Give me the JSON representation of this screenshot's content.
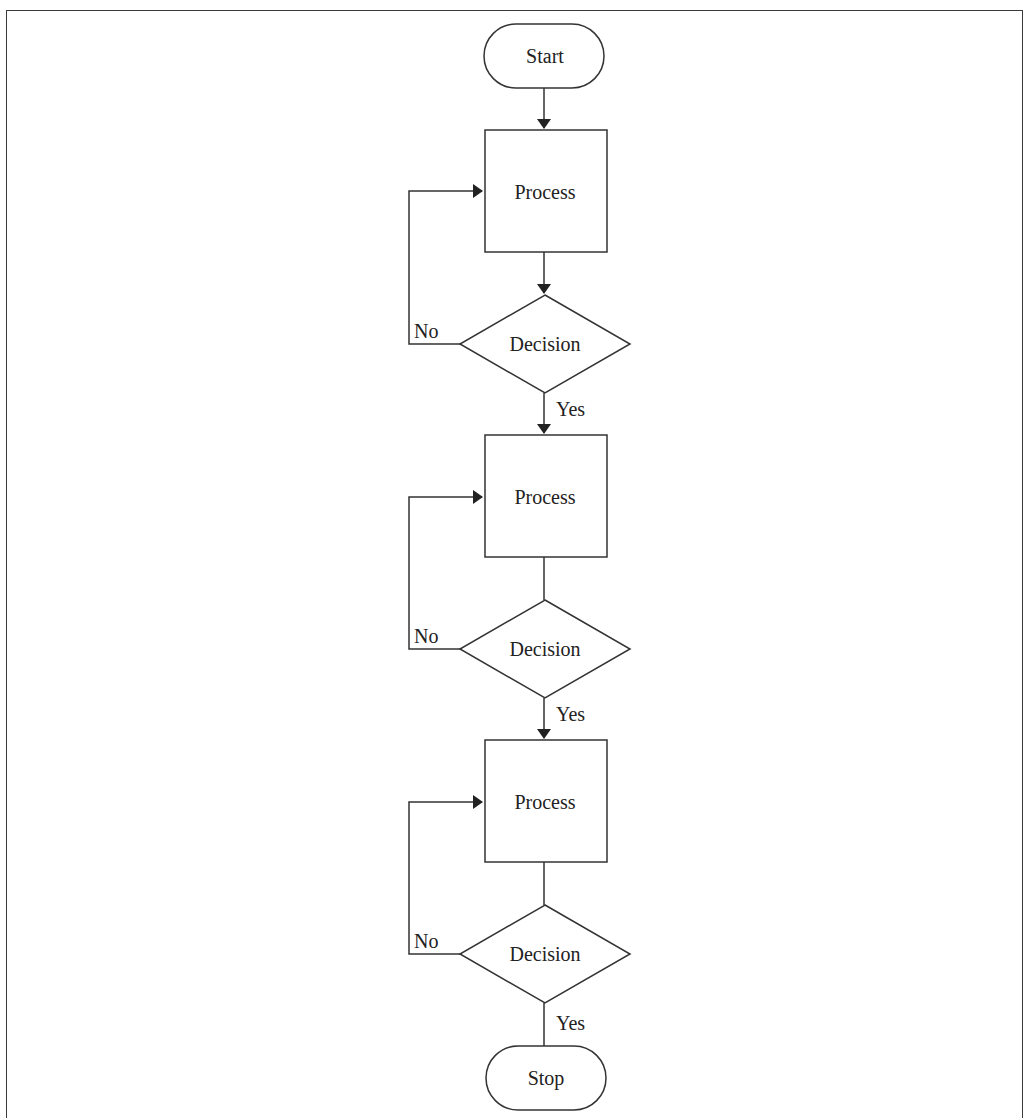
{
  "diagram": {
    "type": "flowchart",
    "nodes": [
      {
        "id": "start",
        "shape": "terminator",
        "label": "Start"
      },
      {
        "id": "p1",
        "shape": "process",
        "label": "Process"
      },
      {
        "id": "d1",
        "shape": "decision",
        "label": "Decision"
      },
      {
        "id": "p2",
        "shape": "process",
        "label": "Process"
      },
      {
        "id": "d2",
        "shape": "decision",
        "label": "Decision"
      },
      {
        "id": "p3",
        "shape": "process",
        "label": "Process"
      },
      {
        "id": "d3",
        "shape": "decision",
        "label": "Decision"
      },
      {
        "id": "stop",
        "shape": "terminator",
        "label": "Stop"
      }
    ],
    "edges": [
      {
        "from": "start",
        "to": "p1",
        "label": ""
      },
      {
        "from": "p1",
        "to": "d1",
        "label": ""
      },
      {
        "from": "d1",
        "to": "p1",
        "label": "No"
      },
      {
        "from": "d1",
        "to": "p2",
        "label": "Yes"
      },
      {
        "from": "p2",
        "to": "d2",
        "label": ""
      },
      {
        "from": "d2",
        "to": "p2",
        "label": "No"
      },
      {
        "from": "d2",
        "to": "p3",
        "label": "Yes"
      },
      {
        "from": "p3",
        "to": "d3",
        "label": ""
      },
      {
        "from": "d3",
        "to": "p3",
        "label": "No"
      },
      {
        "from": "d3",
        "to": "stop",
        "label": "Yes"
      }
    ],
    "labels": {
      "start": "Start",
      "stop": "Stop",
      "process": "Process",
      "decision": "Decision",
      "yes": "Yes",
      "no": "No"
    }
  }
}
